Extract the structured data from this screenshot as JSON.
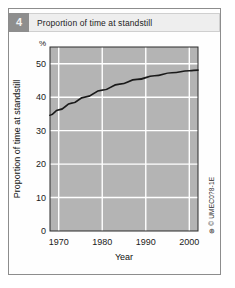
{
  "figure": {
    "number": "4",
    "title": "Proportion of time at standstill",
    "credit": "© UMEC0?8-1E",
    "credit_mark": "⊕"
  },
  "colors": {
    "plot_background": "#b4b4b4",
    "gridline": "#ffffff",
    "curve": "#1a1a1a",
    "axis": "#2b2b2b",
    "badge": "#8e8e8e",
    "title_panel": "#eeeeee",
    "page_background": "#ffffff",
    "frame": "#8d8d8d"
  },
  "chart_data": {
    "type": "line",
    "title": "Proportion of time at standstill",
    "xlabel": "Year",
    "ylabel": "Proportion of time at standstill",
    "yunit": "%",
    "xlim": [
      1968,
      2002
    ],
    "ylim": [
      0,
      55
    ],
    "xticks": [
      1970,
      1980,
      1990,
      2000
    ],
    "xtick_labels": [
      "1970",
      "1980",
      "1990",
      "2000"
    ],
    "yticks": [
      0,
      10,
      20,
      30,
      40,
      50
    ],
    "ytick_labels": [
      "0",
      "10",
      "20",
      "30",
      "40",
      "50"
    ],
    "grid": true,
    "grid_orientation": "both",
    "legend": null,
    "series": [
      {
        "name": "Proportion of time at standstill",
        "x": [
          1968,
          1970,
          1973,
          1976,
          1980,
          1984,
          1988,
          1992,
          1996,
          2000,
          2002
        ],
        "values": [
          34.6,
          36.2,
          38.2,
          40.0,
          42.1,
          43.9,
          45.3,
          46.4,
          47.3,
          47.9,
          48.1
        ]
      }
    ]
  }
}
